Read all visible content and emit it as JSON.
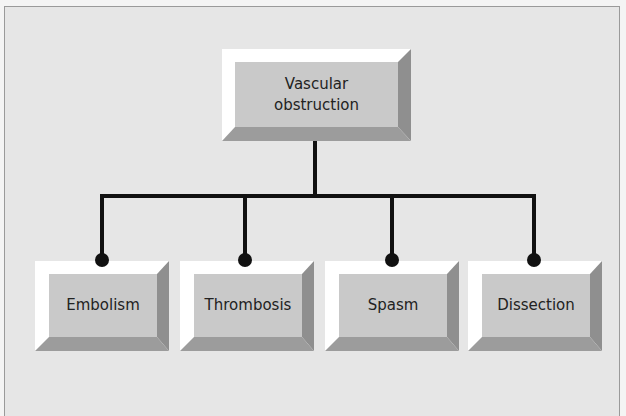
{
  "diagram": {
    "type": "hierarchy",
    "root": {
      "label_line1": "Vascular",
      "label_line2": "obstruction"
    },
    "children": [
      {
        "label": "Embolism"
      },
      {
        "label": "Thrombosis"
      },
      {
        "label": "Spasm"
      },
      {
        "label": "Dissection"
      }
    ],
    "colors": {
      "background": "#e6e6e6",
      "box_face": "#c9c9c9",
      "bevel_light": "#ffffff",
      "bevel_dark": "#8f8f8f",
      "bevel_bottom": "#9c9c9c",
      "connector": "#111111",
      "text": "#222222"
    }
  }
}
